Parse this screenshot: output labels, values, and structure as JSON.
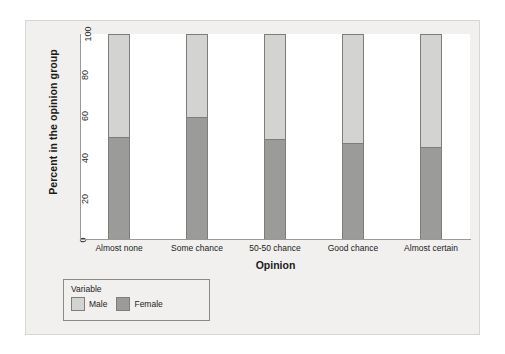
{
  "chart_data": {
    "type": "bar",
    "subtype": "stacked-percent",
    "title": "",
    "xlabel": "Opinion",
    "ylabel": "Percent in the opinion group",
    "categories": [
      "Almost none",
      "Some chance",
      "50-50 chance",
      "Good chance",
      "Almost certain"
    ],
    "series": [
      {
        "name": "Male",
        "color": "#d3d3d1",
        "values": [
          50,
          40,
          51,
          53,
          55
        ]
      },
      {
        "name": "Female",
        "color": "#9b9b99",
        "values": [
          50,
          60,
          49,
          47,
          45
        ]
      }
    ],
    "ylim": [
      0,
      100
    ],
    "yticks": [
      0,
      20,
      40,
      60,
      80,
      100
    ],
    "ytick_labels": [
      "0",
      "20",
      "40",
      "60",
      "80",
      "100"
    ],
    "grid": false,
    "legend_position": "below-left",
    "legend_title": "Variable",
    "stack_order_bottom_to_top": [
      "Female",
      "Male"
    ]
  },
  "legend": {
    "title": "Variable",
    "items": [
      {
        "label": "Male",
        "color": "#d3d3d1"
      },
      {
        "label": "Female",
        "color": "#9b9b99"
      }
    ]
  },
  "axes": {
    "y_title": "Percent in the opinion group",
    "x_title": "Opinion"
  },
  "colors": {
    "panel_background": "#f1f0ee",
    "plot_background": "#ffffff",
    "male": "#d3d3d1",
    "female": "#9b9b99",
    "bar_outline": "#7e7d7a",
    "axis_line": "#9a9996"
  }
}
